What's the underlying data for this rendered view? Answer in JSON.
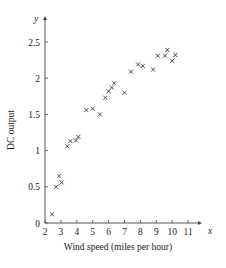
{
  "chart_data": {
    "type": "scatter",
    "title": "",
    "xlabel": "Wind speed (miles per hour)",
    "ylabel": "DC output",
    "x_axis_var": "x",
    "y_axis_var": "y",
    "xlim": [
      1.5,
      12
    ],
    "ylim": [
      0,
      2.75
    ],
    "x_ticks": [
      2,
      3,
      4,
      5,
      6,
      7,
      8,
      9,
      10,
      11
    ],
    "y_ticks": [
      0,
      0.5,
      1,
      1.5,
      2,
      2.5
    ],
    "y_tick_labels": [
      "0",
      "0.5",
      "1",
      "1.5",
      "2",
      "2.5"
    ],
    "grid": false,
    "marker": "x",
    "colors": {
      "marker": "#333333",
      "axis": "#444444"
    },
    "points": [
      {
        "x": 2.45,
        "y": 0.12
      },
      {
        "x": 2.7,
        "y": 0.5
      },
      {
        "x": 2.9,
        "y": 0.65
      },
      {
        "x": 3.05,
        "y": 0.56
      },
      {
        "x": 3.4,
        "y": 1.06
      },
      {
        "x": 3.6,
        "y": 1.13
      },
      {
        "x": 3.95,
        "y": 1.14
      },
      {
        "x": 4.1,
        "y": 1.19
      },
      {
        "x": 4.6,
        "y": 1.56
      },
      {
        "x": 5.0,
        "y": 1.58
      },
      {
        "x": 5.45,
        "y": 1.5
      },
      {
        "x": 5.8,
        "y": 1.73
      },
      {
        "x": 6.0,
        "y": 1.82
      },
      {
        "x": 6.2,
        "y": 1.87
      },
      {
        "x": 6.35,
        "y": 1.93
      },
      {
        "x": 7.0,
        "y": 1.8
      },
      {
        "x": 7.4,
        "y": 2.09
      },
      {
        "x": 7.85,
        "y": 2.19
      },
      {
        "x": 8.15,
        "y": 2.17
      },
      {
        "x": 8.8,
        "y": 2.12
      },
      {
        "x": 9.1,
        "y": 2.31
      },
      {
        "x": 9.55,
        "y": 2.31
      },
      {
        "x": 9.7,
        "y": 2.39
      },
      {
        "x": 10.0,
        "y": 2.24
      },
      {
        "x": 10.2,
        "y": 2.32
      }
    ]
  }
}
